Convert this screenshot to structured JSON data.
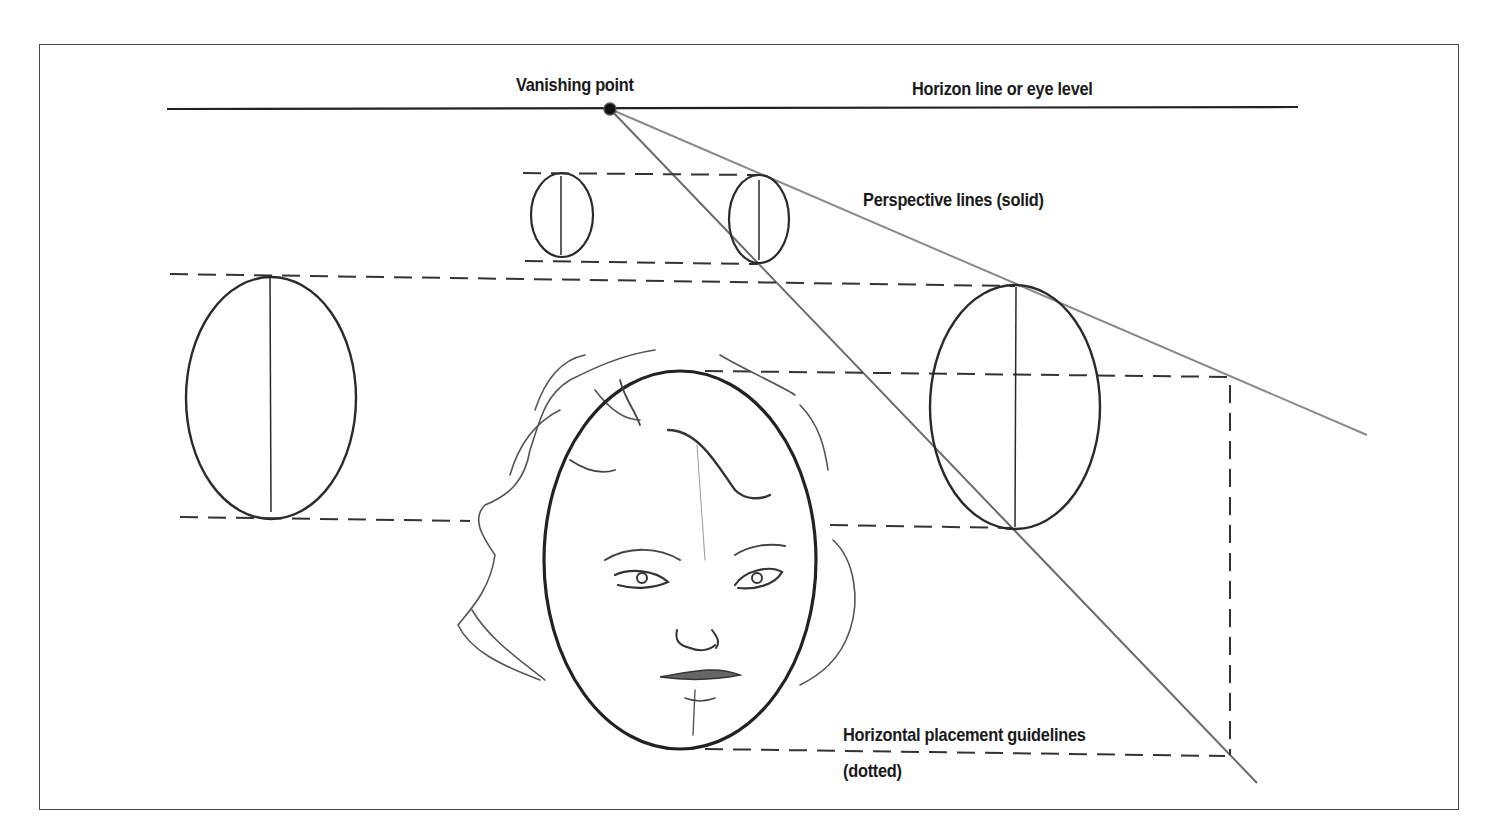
{
  "diagram": {
    "labels": {
      "vanishing_point": "Vanishing point",
      "horizon": "Horizon line or eye level",
      "perspective_lines": "Perspective lines (solid)",
      "guidelines_line1": "Horizontal placement guidelines",
      "guidelines_line2": "(dotted)"
    },
    "colors": {
      "ink": "#2a2a2a",
      "pencil": "#8a8a8a",
      "frame": "#4a4a4a",
      "background": "#ffffff"
    },
    "elements": {
      "horizon_line": {
        "x1": 167,
        "y1": 109,
        "x2": 1298,
        "y2": 107
      },
      "vanishing_point": {
        "cx": 610,
        "cy": 109
      },
      "small_ovals": [
        {
          "cx": 562,
          "cy": 215,
          "rx": 31,
          "ry": 42
        },
        {
          "cx": 759,
          "cy": 219,
          "rx": 30,
          "ry": 44
        }
      ],
      "large_ovals": [
        {
          "cx": 271,
          "cy": 398,
          "rx": 85,
          "ry": 121
        },
        {
          "cx": 1015,
          "cy": 407,
          "rx": 85,
          "ry": 122
        }
      ],
      "face_oval": {
        "cx": 680,
        "cy": 560,
        "rx": 136,
        "ry": 189
      }
    }
  }
}
